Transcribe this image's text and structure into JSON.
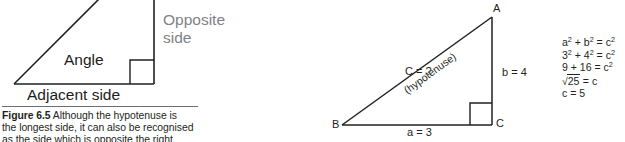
{
  "figure_left": {
    "labels": {
      "opposite": "Opposite\nside",
      "opposite_line1": "Opposite",
      "opposite_line2": "side",
      "angle": "Angle",
      "adjacent": "Adjacent side"
    },
    "caption": {
      "figure_number": "Figure 6.5",
      "line1_rest": " Although the hypotenuse is",
      "line2": "the longest side, it can also be recognised",
      "line3": "as the side which is opposite the right angle"
    },
    "colors": {
      "gray_label": "#808285",
      "black_label": "#1c1c1c",
      "stroke": "#231f20",
      "caption_rule": "#6d6e71"
    }
  },
  "figure_right": {
    "vertices": {
      "A": "A",
      "B": "B",
      "C": "C"
    },
    "labels": {
      "hypotenuse_value": "C = ?",
      "hypotenuse_note": "(hypotenuse)",
      "side_b": "b = 4",
      "side_a": "a = 3"
    },
    "equations": [
      {
        "id": "eq1",
        "text": "a² + b² = c²"
      },
      {
        "id": "eq2",
        "text": "3² + 4² = c²"
      },
      {
        "id": "eq3",
        "text": "9 + 16 = c²"
      },
      {
        "id": "eq4",
        "text": "√25 = c"
      },
      {
        "id": "eq5",
        "text": "c = 5"
      }
    ],
    "equation_parts": {
      "eq1": {
        "base1": "a",
        "exp1": "2",
        "plus": " + ",
        "base2": "b",
        "exp2": "2",
        "eq": " = ",
        "base3": "c",
        "exp3": "2"
      },
      "eq2": {
        "base1": "3",
        "exp1": "2",
        "plus": " + ",
        "base2": "4",
        "exp2": "2",
        "eq": " = ",
        "base3": "c",
        "exp3": "2"
      },
      "eq3": {
        "lhs": "9 + 16",
        "eq": " = ",
        "base3": "c",
        "exp3": "2"
      },
      "eq4": {
        "radical": "√",
        "radicand": "25",
        "eq": " = c"
      },
      "eq5": {
        "text": "c = 5"
      }
    },
    "colors": {
      "stroke": "#231f20",
      "text": "#231f20"
    }
  }
}
